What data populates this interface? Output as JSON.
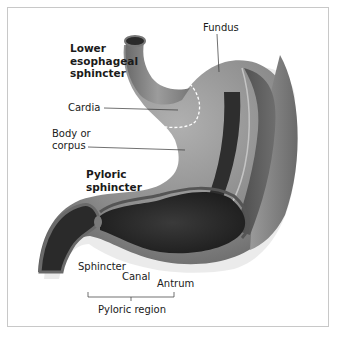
{
  "diagram": {
    "colors": {
      "frame_border": "#c8c8c8",
      "outer_wall": "#8c8c8c",
      "wall_dark": "#3a3a3a",
      "lumen": "#262626",
      "highlight": "#b8b8b8",
      "dashed_boundary": "#ffffff",
      "leader_line": "#333333"
    },
    "labels": {
      "fundus": "Fundus",
      "les": [
        "Lower",
        "esophageal",
        "sphincter"
      ],
      "cardia": "Cardia",
      "body": [
        "Body or",
        "corpus"
      ],
      "pyloric_sphincter": [
        "Pyloric",
        "sphincter"
      ],
      "sphincter": "Sphincter",
      "canal": "Canal",
      "antrum": "Antrum",
      "pyloric_region": "Pyloric region"
    }
  }
}
